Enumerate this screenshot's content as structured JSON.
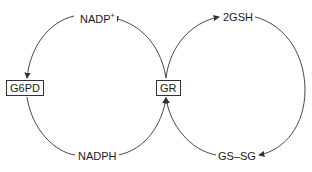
{
  "diagram": {
    "type": "coupled redox cycles",
    "nodes": {
      "nadp_plus": {
        "label": "NADP",
        "superscript": "+"
      },
      "nadph": {
        "label": "NADPH"
      },
      "two_gsh": {
        "label": "2GSH"
      },
      "gssg": {
        "label": "GS–SG"
      },
      "g6pd": {
        "label": "G6PD"
      },
      "gr": {
        "label": "GR"
      }
    },
    "edges": [
      {
        "from": "nadph",
        "to": "nadp_plus",
        "via": "gr",
        "direction": "counterclockwise-up"
      },
      {
        "from": "nadp_plus",
        "to": "nadph",
        "via": "g6pd"
      },
      {
        "from": "gssg",
        "to": "two_gsh",
        "via": "gr"
      },
      {
        "from": "two_gsh",
        "to": "gssg"
      }
    ],
    "colors": {
      "line": "#333333",
      "text": "#1a1a1a",
      "background": "#ffffff"
    }
  }
}
